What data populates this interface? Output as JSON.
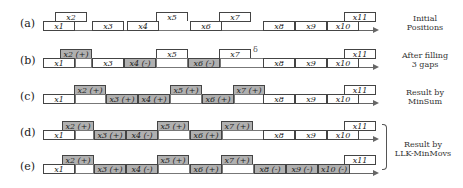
{
  "rows": [
    {
      "label": "(a)",
      "caption": [
        "Initial",
        "Positions"
      ],
      "boxes": [
        {
          "t": "x1",
          "s": ""
        },
        {
          "t": "x2",
          "s": ""
        },
        {
          "t": "x3",
          "s": ""
        },
        {
          "t": "x4",
          "s": ""
        },
        {
          "t": "x5",
          "s": ""
        },
        {
          "t": "x6",
          "s": ""
        },
        {
          "t": "x7",
          "s": ""
        },
        {
          "t": "x8",
          "s": ""
        },
        {
          "t": "x9",
          "s": ""
        },
        {
          "t": "x10",
          "s": ""
        },
        {
          "t": "x11",
          "s": ""
        }
      ]
    },
    {
      "label": "(b)",
      "caption": [
        "After filling",
        "3 gaps"
      ],
      "boxes": [
        {
          "t": "x1",
          "s": ""
        },
        {
          "t": "x2 (+)",
          "s": "moved"
        },
        {
          "t": "x3",
          "s": ""
        },
        {
          "t": "x4 (-)",
          "s": "moved"
        },
        {
          "t": "x5",
          "s": ""
        },
        {
          "t": "x6 (-)",
          "s": "moved"
        },
        {
          "t": "x7",
          "s": ""
        },
        {
          "t": "x8",
          "s": ""
        },
        {
          "t": "x9",
          "s": ""
        },
        {
          "t": "x10",
          "s": ""
        },
        {
          "t": "x11",
          "s": ""
        }
      ]
    },
    {
      "label": "(c)",
      "caption": [
        "Result by",
        "MinSum"
      ],
      "boxes": [
        {
          "t": "x1",
          "s": ""
        },
        {
          "t": "x2 (+)",
          "s": "moved"
        },
        {
          "t": "x3 (+)",
          "s": "moved"
        },
        {
          "t": "x4 (+)",
          "s": "moved"
        },
        {
          "t": "x5 (+)",
          "s": "moved"
        },
        {
          "t": "x6 (+)",
          "s": "moved"
        },
        {
          "t": "x7 (+)",
          "s": "moved"
        },
        {
          "t": "x8",
          "s": ""
        },
        {
          "t": "x9",
          "s": ""
        },
        {
          "t": "x10",
          "s": ""
        },
        {
          "t": "x11",
          "s": ""
        }
      ]
    },
    {
      "label": "(d)",
      "caption": [],
      "boxes": [
        {
          "t": "x1",
          "s": ""
        },
        {
          "t": "x2 (+)",
          "s": "moved"
        },
        {
          "t": "x3 (+)",
          "s": "moved"
        },
        {
          "t": "x4 (-)",
          "s": "moved"
        },
        {
          "t": "x5 (+)",
          "s": "moved"
        },
        {
          "t": "x6 (+)",
          "s": "moved"
        },
        {
          "t": "x7 (+)",
          "s": "moved"
        },
        {
          "t": "x8",
          "s": ""
        },
        {
          "t": "x9",
          "s": ""
        },
        {
          "t": "x10",
          "s": ""
        },
        {
          "t": "x11",
          "s": ""
        }
      ]
    },
    {
      "label": "(e)",
      "caption": [],
      "boxes": [
        {
          "t": "x1",
          "s": ""
        },
        {
          "t": "x2 (+)",
          "s": "moved"
        },
        {
          "t": "x3 (+)",
          "s": "moved"
        },
        {
          "t": "x4 (-)",
          "s": "moved"
        },
        {
          "t": "x5 (+)",
          "s": "moved"
        },
        {
          "t": "x6 (+)",
          "s": "moved"
        },
        {
          "t": "x7 (+)",
          "s": "moved"
        },
        {
          "t": "x8 (-)",
          "s": "moved"
        },
        {
          "t": "x9 (-)",
          "s": "moved"
        },
        {
          "t": "x10 (-)",
          "s": "moved"
        },
        {
          "t": "x11",
          "s": ""
        }
      ]
    }
  ],
  "shared_caption": [
    "Result by",
    "LLK-MinMovs"
  ],
  "gap_marker": "δ",
  "colors": {
    "moved_fill": "#b0b0b0",
    "border": "#444444",
    "axis": "#666666"
  }
}
